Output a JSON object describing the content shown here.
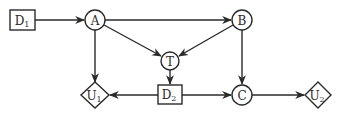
{
  "diagram": {
    "type": "influence-diagram",
    "colors": {
      "stroke": "#2a2a2a",
      "background": "#ffffff"
    },
    "nodes": [
      {
        "id": "D1",
        "kind": "decision",
        "shape": "rectangle",
        "base": "D",
        "sub": "1"
      },
      {
        "id": "A",
        "kind": "chance",
        "shape": "circle",
        "base": "A",
        "sub": ""
      },
      {
        "id": "B",
        "kind": "chance",
        "shape": "circle",
        "base": "B",
        "sub": ""
      },
      {
        "id": "T",
        "kind": "chance",
        "shape": "circle",
        "base": "T",
        "sub": ""
      },
      {
        "id": "D2",
        "kind": "decision",
        "shape": "rectangle",
        "base": "D",
        "sub": "2"
      },
      {
        "id": "U1",
        "kind": "utility",
        "shape": "diamond",
        "base": "U",
        "sub": "1"
      },
      {
        "id": "C",
        "kind": "chance",
        "shape": "circle",
        "base": "C",
        "sub": ""
      },
      {
        "id": "U2",
        "kind": "utility",
        "shape": "diamond",
        "base": "U",
        "sub": "2"
      }
    ],
    "edges": [
      {
        "from": "D1",
        "to": "A"
      },
      {
        "from": "A",
        "to": "B"
      },
      {
        "from": "A",
        "to": "T"
      },
      {
        "from": "B",
        "to": "T"
      },
      {
        "from": "A",
        "to": "U1"
      },
      {
        "from": "T",
        "to": "D2"
      },
      {
        "from": "D2",
        "to": "U1"
      },
      {
        "from": "D2",
        "to": "C"
      },
      {
        "from": "B",
        "to": "C"
      },
      {
        "from": "C",
        "to": "U2"
      }
    ]
  }
}
